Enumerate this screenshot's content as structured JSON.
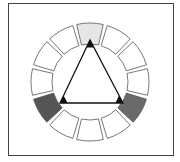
{
  "diagram": {
    "type": "color-wheel-triad",
    "segment_count": 12,
    "center": [
      90,
      82
    ],
    "outer_radius": 59,
    "inner_radius": 38,
    "colors": {
      "frame": "#444444",
      "segment_stroke": "#555555",
      "segment_default": "#ffffff",
      "triangle": "#111111"
    },
    "segments": [
      {
        "index": 0,
        "angle": 0,
        "fill": "#e6e6e6",
        "highlighted": true
      },
      {
        "index": 1,
        "angle": 30,
        "fill": "#ffffff",
        "highlighted": false
      },
      {
        "index": 2,
        "angle": 60,
        "fill": "#ffffff",
        "highlighted": false
      },
      {
        "index": 3,
        "angle": 90,
        "fill": "#ffffff",
        "highlighted": false
      },
      {
        "index": 4,
        "angle": 120,
        "fill": "#6a6a6a",
        "highlighted": true
      },
      {
        "index": 5,
        "angle": 150,
        "fill": "#ffffff",
        "highlighted": false
      },
      {
        "index": 6,
        "angle": 180,
        "fill": "#ffffff",
        "highlighted": false
      },
      {
        "index": 7,
        "angle": 210,
        "fill": "#ffffff",
        "highlighted": false
      },
      {
        "index": 8,
        "angle": 240,
        "fill": "#555555",
        "highlighted": true
      },
      {
        "index": 9,
        "angle": 270,
        "fill": "#ffffff",
        "highlighted": false
      },
      {
        "index": 10,
        "angle": 300,
        "fill": "#ffffff",
        "highlighted": false
      },
      {
        "index": 11,
        "angle": 330,
        "fill": "#ffffff",
        "highlighted": false
      }
    ],
    "triangle": {
      "vertices": [
        [
          90,
          40
        ],
        [
          60,
          103
        ],
        [
          123,
          103
        ]
      ]
    }
  }
}
